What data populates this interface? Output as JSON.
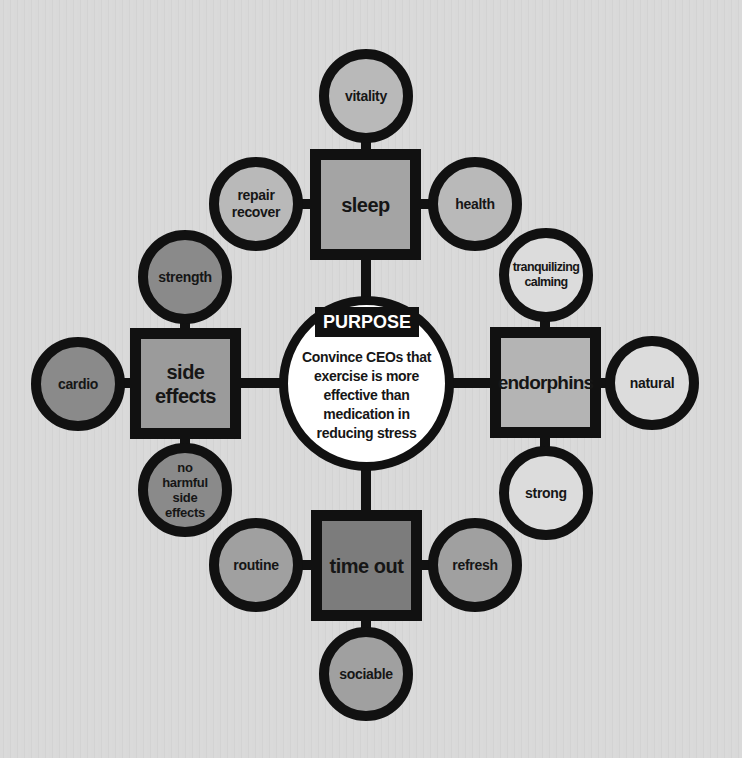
{
  "colors": {
    "background": "#d8d8d8",
    "outline": "#111111",
    "center_fill": "#ffffff",
    "sleep_group_fill": "#b9b9b9",
    "sleep_square_fill": "#a4a4a4",
    "side_effects_group_fill": "#8a8a8a",
    "side_effects_square_fill": "#9b9b9b",
    "endorphins_group_fill": "#dcdcdc",
    "endorphins_square_fill": "#b4b4b4",
    "time_out_group_fill": "#a0a0a0",
    "time_out_square_fill": "#7c7c7c"
  },
  "center": {
    "tag": "PURPOSE",
    "text": "Convince CEOs that\nexercise is more\neffective than\nmedication in\nreducing stress"
  },
  "hubs": [
    {
      "id": "sleep",
      "label": "sleep",
      "satellites": [
        {
          "position": "top",
          "label": "vitality"
        },
        {
          "position": "left",
          "label": "repair\nrecover"
        },
        {
          "position": "right",
          "label": "health"
        }
      ]
    },
    {
      "id": "side-effects",
      "label": "side\neffects",
      "satellites": [
        {
          "position": "top",
          "label": "strength"
        },
        {
          "position": "left",
          "label": "cardio"
        },
        {
          "position": "bottom",
          "label": "no\nharmful\nside\neffects"
        }
      ]
    },
    {
      "id": "endorphins",
      "label": "endorphins",
      "satellites": [
        {
          "position": "top",
          "label": "tranquilizing\ncalming"
        },
        {
          "position": "right",
          "label": "natural"
        },
        {
          "position": "bottom",
          "label": "strong"
        }
      ]
    },
    {
      "id": "time-out",
      "label": "time out",
      "satellites": [
        {
          "position": "left",
          "label": "routine"
        },
        {
          "position": "right",
          "label": "refresh"
        },
        {
          "position": "bottom",
          "label": "sociable"
        }
      ]
    }
  ]
}
